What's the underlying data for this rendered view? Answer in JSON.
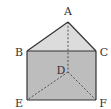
{
  "diagram": {
    "type": "triangular-prism",
    "colors": {
      "top_face": "#dcdcdc",
      "front_face": "#bdbdbd",
      "edge": "#333333",
      "hidden_edge": "#444444",
      "label": "#333333"
    },
    "vertices": {
      "A": {
        "label": "A",
        "x": 68,
        "y": 22,
        "lx": 68,
        "ly": 15
      },
      "B": {
        "label": "B",
        "x": 27,
        "y": 51,
        "lx": 19,
        "ly": 56
      },
      "C": {
        "label": "C",
        "x": 96,
        "y": 51,
        "lx": 104,
        "ly": 56
      },
      "D": {
        "label": "D",
        "x": 68,
        "y": 72,
        "lx": 61,
        "ly": 74
      },
      "E": {
        "label": "E",
        "x": 27,
        "y": 100,
        "lx": 19,
        "ly": 107
      },
      "F": {
        "label": "F",
        "x": 96,
        "y": 100,
        "lx": 103,
        "ly": 107
      }
    },
    "solid_edges": [
      [
        "A",
        "B"
      ],
      [
        "A",
        "C"
      ],
      [
        "B",
        "C"
      ],
      [
        "B",
        "E"
      ],
      [
        "C",
        "F"
      ],
      [
        "E",
        "F"
      ]
    ],
    "dashed_edges": [
      [
        "A",
        "D"
      ],
      [
        "D",
        "E"
      ],
      [
        "D",
        "F"
      ]
    ]
  }
}
